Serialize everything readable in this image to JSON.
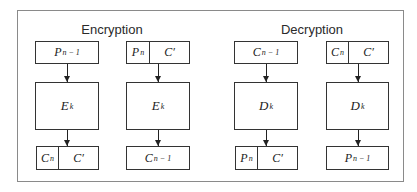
{
  "diagram": {
    "sections": [
      {
        "title": "Encryption",
        "columns": [
          {
            "input": {
              "type": "single",
              "main": "P",
              "sub": "n − 1"
            },
            "operation": {
              "main": "E",
              "sub": "k"
            },
            "output": {
              "type": "split",
              "first_main": "C",
              "first_sub": "n",
              "second_main": "C′",
              "second_sub": ""
            }
          },
          {
            "input": {
              "type": "split",
              "first_main": "P",
              "first_sub": "n",
              "second_main": "C′",
              "second_sub": ""
            },
            "operation": {
              "main": "E",
              "sub": "k"
            },
            "output": {
              "type": "single",
              "main": "C",
              "sub": "n − 1"
            }
          }
        ]
      },
      {
        "title": "Decryption",
        "columns": [
          {
            "input": {
              "type": "single",
              "main": "C",
              "sub": "n − 1"
            },
            "operation": {
              "main": "D",
              "sub": "k"
            },
            "output": {
              "type": "split",
              "first_main": "P",
              "first_sub": "n",
              "second_main": "C′",
              "second_sub": ""
            }
          },
          {
            "input": {
              "type": "split",
              "first_main": "C",
              "first_sub": "n",
              "second_main": "C′",
              "second_sub": ""
            },
            "operation": {
              "main": "D",
              "sub": "k"
            },
            "output": {
              "type": "single",
              "main": "P",
              "sub": "n − 1"
            }
          }
        ]
      }
    ]
  }
}
